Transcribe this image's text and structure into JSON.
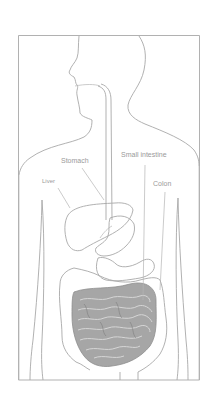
{
  "figure": {
    "labels": {
      "stomach": "Stomach",
      "small_intestine": "Small intestine",
      "liver": "Liver",
      "colon": "Colon"
    },
    "colors": {
      "line": "#a8a8a8",
      "intestine_fill": "#a0a0a0",
      "label": "#9a9a9a",
      "background": "#ffffff"
    }
  }
}
